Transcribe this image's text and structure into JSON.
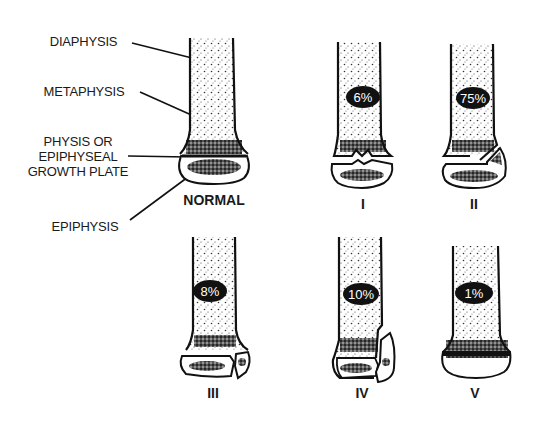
{
  "diagram": {
    "type": "anatomical illustration",
    "labels": {
      "diaphysis": "DIAPHYSIS",
      "metaphysis": "METAPHYSIS",
      "physis_line1": "PHYSIS OR",
      "physis_line2": "EPIPHYSEAL",
      "physis_line3": "GROWTH PLATE",
      "epiphysis": "EPIPHYSIS"
    },
    "panels": [
      {
        "id": "normal",
        "caption": "NORMAL",
        "percent": null
      },
      {
        "id": "type-1",
        "caption": "I",
        "percent": "6%"
      },
      {
        "id": "type-2",
        "caption": "II",
        "percent": "75%"
      },
      {
        "id": "type-3",
        "caption": "III",
        "percent": "8%"
      },
      {
        "id": "type-4",
        "caption": "IV",
        "percent": "10%"
      },
      {
        "id": "type-5",
        "caption": "V",
        "percent": "1%"
      }
    ],
    "colors": {
      "ink": "#111111",
      "background": "#ffffff"
    }
  }
}
